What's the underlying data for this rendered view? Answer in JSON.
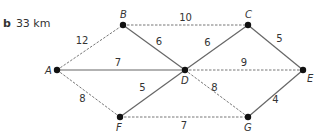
{
  "answer": {
    "part": "b",
    "value": "33 km"
  },
  "graph": {
    "nodes": [
      {
        "id": "A",
        "label": "A"
      },
      {
        "id": "B",
        "label": "B"
      },
      {
        "id": "C",
        "label": "C"
      },
      {
        "id": "D",
        "label": "D"
      },
      {
        "id": "E",
        "label": "E"
      },
      {
        "id": "F",
        "label": "F"
      },
      {
        "id": "G",
        "label": "G"
      }
    ],
    "edges": [
      {
        "from": "A",
        "to": "B",
        "weight": "12",
        "style": "dashed"
      },
      {
        "from": "A",
        "to": "D",
        "weight": "7",
        "style": "solid"
      },
      {
        "from": "A",
        "to": "F",
        "weight": "8",
        "style": "dashed"
      },
      {
        "from": "B",
        "to": "C",
        "weight": "10",
        "style": "dashed"
      },
      {
        "from": "B",
        "to": "D",
        "weight": "6",
        "style": "solid"
      },
      {
        "from": "C",
        "to": "D",
        "weight": "6",
        "style": "solid"
      },
      {
        "from": "C",
        "to": "E",
        "weight": "5",
        "style": "solid"
      },
      {
        "from": "D",
        "to": "E",
        "weight": "9",
        "style": "dashed"
      },
      {
        "from": "D",
        "to": "F",
        "weight": "5",
        "style": "solid"
      },
      {
        "from": "D",
        "to": "G",
        "weight": "8",
        "style": "dashed"
      },
      {
        "from": "F",
        "to": "G",
        "weight": "7",
        "style": "dashed"
      },
      {
        "from": "G",
        "to": "E",
        "weight": "4",
        "style": "solid"
      }
    ]
  }
}
